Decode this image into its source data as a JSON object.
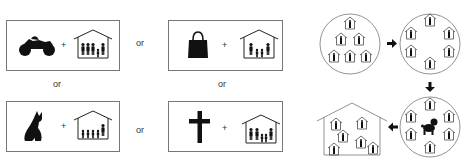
{
  "left_panel": {
    "connector_label": "or",
    "plus_label": "+",
    "options": [
      {
        "id": "motorcycle",
        "icon": "motorcycle-icon",
        "household": "family-house-5-members"
      },
      {
        "id": "handbag",
        "icon": "handbag-icon",
        "household": "family-house-4-members"
      },
      {
        "id": "dog",
        "icon": "dog-icon",
        "household": "family-house-5-members"
      },
      {
        "id": "cross",
        "icon": "cross-icon",
        "household": "family-house-5-members"
      }
    ],
    "connectors": [
      "or",
      "or",
      "or",
      "or"
    ]
  },
  "right_panel": {
    "stages": [
      {
        "id": "cluster-of-households",
        "shape": "circle",
        "houses": 6
      },
      {
        "id": "ring-of-single-households",
        "shape": "circle",
        "houses": 6
      },
      {
        "id": "ring-with-dog-center",
        "shape": "circle",
        "houses": 7,
        "center_icon": "dog-icon"
      },
      {
        "id": "big-shared-house",
        "shape": "house",
        "houses": 6
      }
    ],
    "arrows": [
      "right",
      "down",
      "left"
    ]
  },
  "colors": {
    "stroke": "#777777",
    "fill": "#000000",
    "background": "#ffffff"
  }
}
